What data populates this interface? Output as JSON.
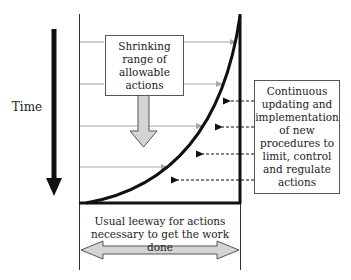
{
  "diagram": {
    "time_label": "Time",
    "top_box_text": "Shrinking range of allowable actions",
    "top_box_lines": [
      "Shrinking",
      "range of",
      "allowable",
      "actions"
    ],
    "right_box_lines": [
      "Continuous",
      "updating and",
      "implementation",
      "of new",
      "procedures to",
      "limit, control",
      "and regulate",
      "actions"
    ],
    "bottom_text_lines": [
      "Usual leeway for actions",
      "necessary to get the work done"
    ],
    "colors": {
      "line": "#111111",
      "gray_arrow": "#a8a8a8",
      "block_arrow_fill": "#d4d4d4",
      "block_arrow_stroke": "#555555",
      "box_border": "#555555"
    },
    "solid_arrows_y": [
      42,
      84,
      126,
      167
    ],
    "dashed_arrows_y": [
      101,
      127,
      154,
      180
    ]
  }
}
